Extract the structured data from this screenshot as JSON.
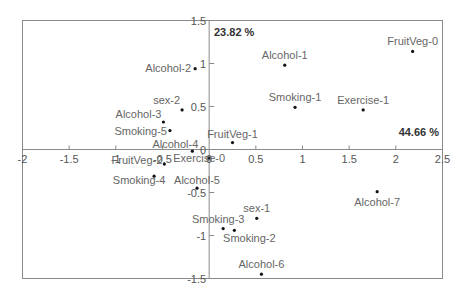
{
  "chart_data": {
    "type": "scatter",
    "title": "",
    "xlabel": "",
    "ylabel": "",
    "xlim": [
      -2,
      2.5
    ],
    "ylim": [
      -1.5,
      1.5
    ],
    "grid": false,
    "x_ticks": [
      -2,
      -1.5,
      -1,
      -0.5,
      0,
      0.5,
      1,
      1.5,
      2,
      2.5
    ],
    "x_tick_labels": [
      "-2",
      "-1.5",
      "-1",
      "-0.5",
      "0",
      "0.5",
      "1",
      "1.5",
      "2",
      "2.5"
    ],
    "y_ticks": [
      1.5,
      1,
      0.5,
      0,
      -0.5,
      -1,
      -1.5
    ],
    "y_tick_labels": [
      "1.5",
      "1",
      "0.5",
      "0",
      "-0.5",
      "-1",
      "-1.5"
    ],
    "annotations": [
      {
        "text": "23.82 %",
        "axis": "vertical",
        "position": "top"
      },
      {
        "text": "44.66 %",
        "axis": "horizontal",
        "position": "right"
      }
    ],
    "points": [
      {
        "label": "Alcohol-2",
        "x": -0.15,
        "y": 0.94
      },
      {
        "label": "sex-2",
        "x": -0.29,
        "y": 0.46
      },
      {
        "label": "Alcohol-3",
        "x": -0.49,
        "y": 0.32
      },
      {
        "label": "Smoking-5",
        "x": -0.42,
        "y": 0.22
      },
      {
        "label": "Alcohol-4",
        "x": -0.18,
        "y": -0.02
      },
      {
        "label": "FruitVeg-1",
        "x": 0.25,
        "y": 0.08
      },
      {
        "label": "Alcohol-1",
        "x": 0.81,
        "y": 0.98
      },
      {
        "label": "FruitVeg-0",
        "x": 2.18,
        "y": 1.14
      },
      {
        "label": "Smoking-1",
        "x": 0.92,
        "y": 0.49
      },
      {
        "label": "Exercise-1",
        "x": 1.65,
        "y": 0.46
      },
      {
        "label": "Exercise-0",
        "x": 0.0,
        "y": -0.1
      },
      {
        "label": "FruitVeg-2",
        "x": -0.48,
        "y": -0.17
      },
      {
        "label": "Smoking-4",
        "x": -0.59,
        "y": -0.31
      },
      {
        "label": "Alcohol-5",
        "x": -0.13,
        "y": -0.45
      },
      {
        "label": "Alcohol-7",
        "x": 1.8,
        "y": -0.49
      },
      {
        "label": "sex-1",
        "x": 0.51,
        "y": -0.8
      },
      {
        "label": "Smoking-3",
        "x": 0.15,
        "y": -0.92
      },
      {
        "label": "Smoking-2",
        "x": 0.27,
        "y": -0.94
      },
      {
        "label": "Alcohol-6",
        "x": 0.56,
        "y": -1.45
      }
    ]
  }
}
